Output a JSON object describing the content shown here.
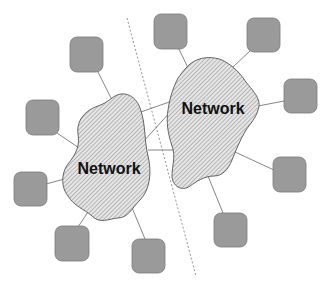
{
  "diagram": {
    "type": "network-topology",
    "colors": {
      "node_fill": "#9a9a9a",
      "node_stroke": "#7a7a7a",
      "cloud_fill": "#e4e4e4",
      "cloud_hatch": "#8c8c8c",
      "cloud_stroke": "#555555",
      "link": "#777777",
      "divider": "#888888"
    },
    "networks": [
      {
        "id": "left",
        "label": "Network"
      },
      {
        "id": "right",
        "label": "Network"
      }
    ],
    "nodes": [
      {
        "id": "n1",
        "network": "left",
        "x": 70,
        "y": 37
      },
      {
        "id": "n2",
        "network": "left",
        "x": 26,
        "y": 100
      },
      {
        "id": "n3",
        "network": "left",
        "x": 14,
        "y": 172
      },
      {
        "id": "n4",
        "network": "left",
        "x": 55,
        "y": 226
      },
      {
        "id": "n5",
        "network": "left",
        "x": 132,
        "y": 239
      },
      {
        "id": "n6",
        "network": "right",
        "x": 154,
        "y": 14
      },
      {
        "id": "n7",
        "network": "right",
        "x": 247,
        "y": 18
      },
      {
        "id": "n8",
        "network": "right",
        "x": 284,
        "y": 79
      },
      {
        "id": "n9",
        "network": "right",
        "x": 273,
        "y": 157
      },
      {
        "id": "n10",
        "network": "right",
        "x": 214,
        "y": 213
      }
    ],
    "inter_network_links": 3,
    "divider": "dashed diagonal line separating the two networks"
  }
}
